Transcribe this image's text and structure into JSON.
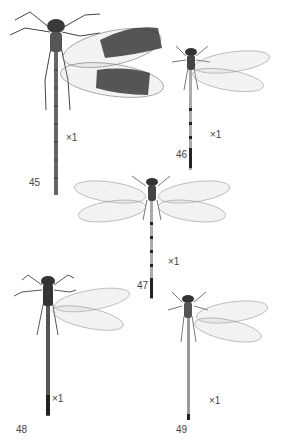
{
  "plate": {
    "background": "#ffffff",
    "ink_color": "#333333",
    "figures": [
      {
        "number": "45",
        "scale": "×1",
        "wing_type": "dark-banded"
      },
      {
        "number": "46",
        "scale": "×1",
        "wing_type": "clear"
      },
      {
        "number": "47",
        "scale": "×1",
        "wing_type": "clear-spread"
      },
      {
        "number": "48",
        "scale": "×1",
        "wing_type": "clear"
      },
      {
        "number": "49",
        "scale": "×1",
        "wing_type": "clear"
      }
    ]
  }
}
